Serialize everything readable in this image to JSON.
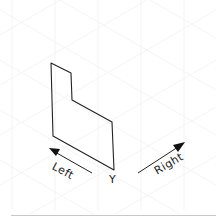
{
  "diagram": {
    "type": "isometric-sketch",
    "background_grid": "faint isometric grid",
    "shape": {
      "description": "hand-drawn L-shaped face (extruded profile) on isometric grid",
      "points": [
        [
          51,
          63
        ],
        [
          71,
          73
        ],
        [
          72,
          100
        ],
        [
          112,
          122
        ],
        [
          114,
          170
        ],
        [
          53,
          136
        ]
      ],
      "stroke": "#222222"
    },
    "labels": {
      "left": "Left",
      "right": "Right",
      "vertical_axis": "Y"
    },
    "arrows": {
      "left": {
        "from": [
          92,
          173
        ],
        "to": [
          49,
          149
        ]
      },
      "right": {
        "from": [
          138,
          173
        ],
        "to": [
          184,
          143
        ]
      }
    }
  },
  "colors": {
    "ink": "#222222",
    "grid": "#f1f1f1",
    "baseline": "#c8c8c8"
  }
}
